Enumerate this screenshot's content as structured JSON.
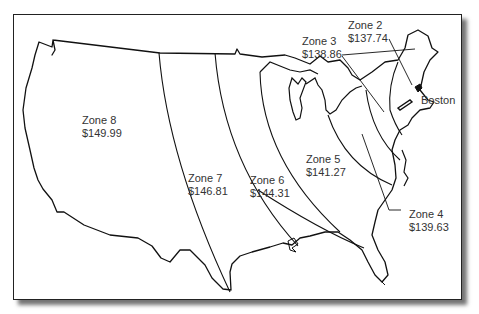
{
  "map": {
    "title": "",
    "zones": [
      {
        "id": "zone-2",
        "name": "Zone 2",
        "price": "$137.74"
      },
      {
        "id": "zone-3",
        "name": "Zone 3",
        "price": "$138.86"
      },
      {
        "id": "zone-4",
        "name": "Zone 4",
        "price": "$139.63"
      },
      {
        "id": "zone-5",
        "name": "Zone 5",
        "price": "$141.27"
      },
      {
        "id": "zone-6",
        "name": "Zone 6",
        "price": "$144.31"
      },
      {
        "id": "zone-7",
        "name": "Zone 7",
        "price": "$146.81"
      },
      {
        "id": "zone-8",
        "name": "Zone 8",
        "price": "$149.99"
      }
    ],
    "origin": {
      "label": "Boston"
    }
  }
}
